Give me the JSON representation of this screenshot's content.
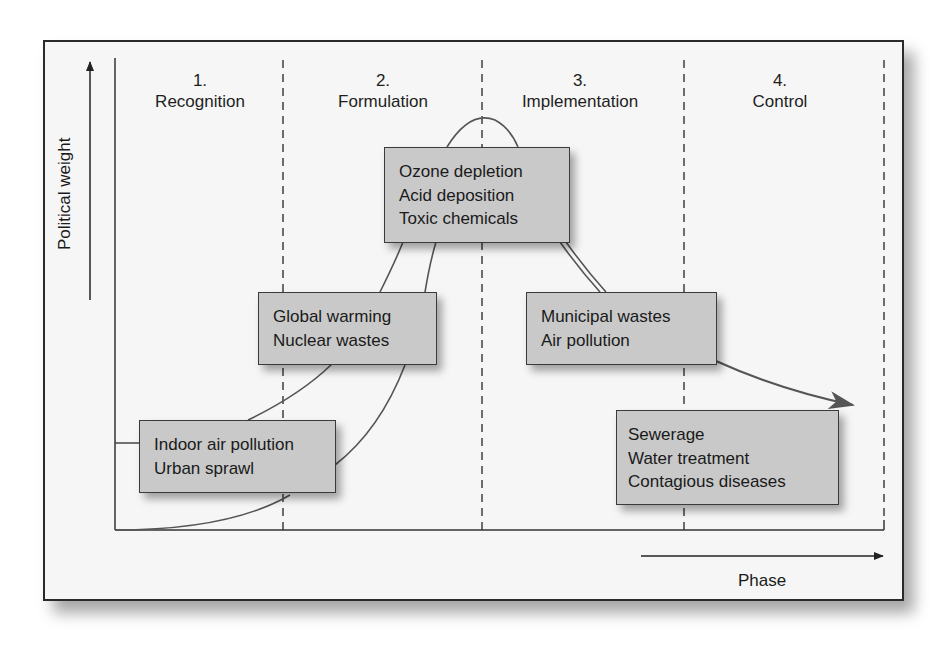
{
  "diagram": {
    "y_axis_label": "Political weight",
    "x_axis_label": "Phase",
    "phases": [
      {
        "number": "1.",
        "name": "Recognition"
      },
      {
        "number": "2.",
        "name": "Formulation"
      },
      {
        "number": "3.",
        "name": "Implementation"
      },
      {
        "number": "4.",
        "name": "Control"
      }
    ],
    "boxes": [
      {
        "id": "recognition-issues",
        "lines": [
          "Indoor air pollution",
          "Urban sprawl"
        ]
      },
      {
        "id": "formulation-issues",
        "lines": [
          "Global warming",
          "Nuclear wastes"
        ]
      },
      {
        "id": "peak-issues",
        "lines": [
          "Ozone depletion",
          "Acid deposition",
          "Toxic chemicals"
        ]
      },
      {
        "id": "implementation-issues",
        "lines": [
          "Municipal wastes",
          "Air pollution"
        ]
      },
      {
        "id": "control-issues",
        "lines": [
          "Sewerage",
          "Water treatment",
          "Contagious diseases"
        ]
      }
    ],
    "colors": {
      "box_fill": "#c9c9c9",
      "curve": "#555555",
      "frame": "#2a2a2a",
      "background": "#f6f6f6"
    }
  }
}
